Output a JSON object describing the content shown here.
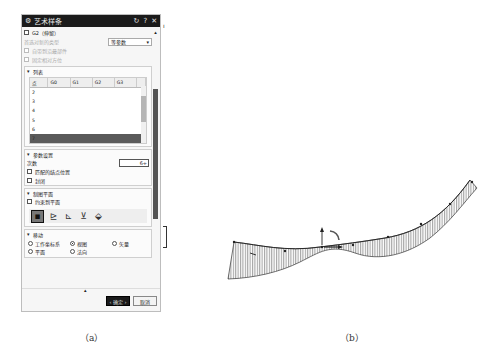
{
  "dialog": {
    "title": "艺术样条",
    "title_icons": [
      "reset-icon",
      "help-icon",
      "close-icon"
    ],
    "g2_label": "G2（伸留）",
    "match_type_label": "首选对新的类型",
    "match_type_value": "等参数",
    "cb1_label": "自带到沿最部件",
    "cb2_label": "固定相对方位",
    "list_group": {
      "title": "列表",
      "columns": [
        "点",
        "G0",
        "G1",
        "G2",
        "G3"
      ],
      "rows": [
        "2",
        "3",
        "4",
        "5",
        "6",
        "7"
      ]
    },
    "param_group": {
      "title": "参数设置",
      "degree_label": "次数",
      "degree_value": "6",
      "cb_match_knots": "匹配的结点位置",
      "cb_closed": "封闭"
    },
    "plane_group": {
      "title": "制图平面",
      "cb_constrain": "约束到平面",
      "tools": [
        "view-plane",
        "xc-plane",
        "xz-plane",
        "yz-plane",
        "custom-plane"
      ]
    },
    "move_group": {
      "title": "移动",
      "radios": [
        {
          "label": "工作坐标系",
          "on": false
        },
        {
          "label": "视图",
          "on": true
        },
        {
          "label": "矢量",
          "on": false
        },
        {
          "label": "平面",
          "on": false
        },
        {
          "label": "法向",
          "on": false
        }
      ]
    },
    "ok_label": "‹ 确定 ›",
    "cancel_label": "取消"
  },
  "captions": {
    "a": "（a）",
    "b": "（b）"
  }
}
